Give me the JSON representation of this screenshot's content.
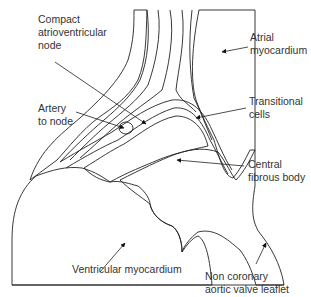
{
  "figure": {
    "type": "anatomical line diagram",
    "colors": {
      "line": "#222222",
      "text": "#333333",
      "background": "#ffffff",
      "stipple": "#777777"
    }
  },
  "labels": {
    "compact_av_node": [
      "Compact",
      "atrioventricular",
      "node"
    ],
    "artery_to_node": [
      "Artery",
      "to node"
    ],
    "atrial_myocardium": [
      "Atrial",
      "myocardium"
    ],
    "transitional_cells": [
      "Transitional",
      "cells"
    ],
    "central_fibrous_body": [
      "Central",
      "fibrous body"
    ],
    "ventricular_myocardium": [
      "Ventricular myocardium"
    ],
    "non_coronary_leaflet": [
      "Non coronary",
      "aortic valve leaflet"
    ]
  },
  "regions": [
    {
      "name": "atrial-myocardium",
      "fill": "horizontal hatching"
    },
    {
      "name": "transitional-cells",
      "fill": "wavy lines"
    },
    {
      "name": "compact-av-node",
      "fill": "blank"
    },
    {
      "name": "central-fibrous-body",
      "fill": "stippled"
    },
    {
      "name": "ventricular-myocardium",
      "fill": "vertical hatching"
    },
    {
      "name": "aortic-valve-leaflet",
      "fill": "stippled"
    }
  ]
}
